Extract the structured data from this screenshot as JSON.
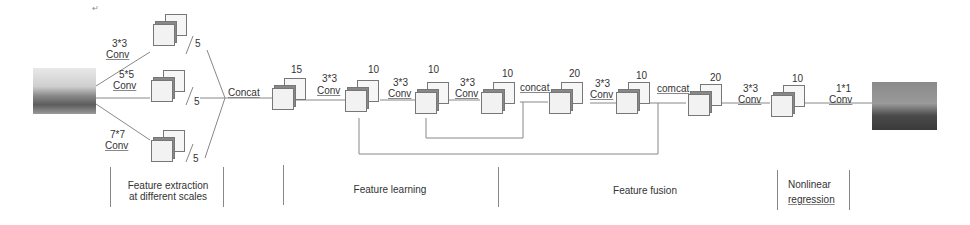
{
  "diagram": {
    "input_image": "indoor-hazy-scene",
    "output_image": "dehazed-scene",
    "multiscale_branches": [
      {
        "kernel": "3*3",
        "op": "Conv",
        "channels": "5"
      },
      {
        "kernel": "5*5",
        "op": "Conv",
        "channels": "5"
      },
      {
        "kernel": "7*7",
        "op": "Conv",
        "channels": "5"
      }
    ],
    "concat_label": "Concat",
    "blocks": [
      {
        "channels": "15"
      },
      {
        "channels": "10"
      },
      {
        "channels": "10"
      },
      {
        "channels": "10"
      },
      {
        "channels": "20"
      },
      {
        "channels": "10"
      },
      {
        "channels": "20"
      },
      {
        "channels": "10"
      }
    ],
    "edges": [
      {
        "kernel": "3*3",
        "op": "Conv"
      },
      {
        "kernel": "3*3",
        "op": "Conv"
      },
      {
        "kernel": "3*3",
        "op": "Conv"
      },
      {
        "label": "concat"
      },
      {
        "kernel": "3*3",
        "op": "Conv"
      },
      {
        "label": "comcat"
      },
      {
        "kernel": "3*3",
        "op": "Conv"
      },
      {
        "kernel": "1*1",
        "op": "Conv"
      }
    ],
    "sections": [
      {
        "label": "Feature extraction\nat different scales",
        "line1": "Feature extraction",
        "line2": "at different scales"
      },
      {
        "label": "Feature learning"
      },
      {
        "label": "Feature fusion"
      },
      {
        "label": "Nonlinear regression",
        "line1": "Nonlinear",
        "line2": "regression"
      }
    ]
  }
}
